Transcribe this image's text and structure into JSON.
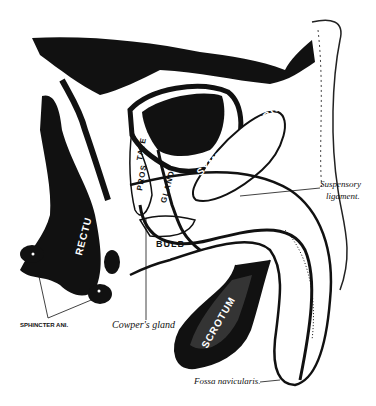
{
  "figure": {
    "colors": {
      "ink": "#111111",
      "paper": "#ffffff"
    },
    "labels": {
      "symphysis_pubis": "SYMPHYSIS PUBIS",
      "prostate_part1": "PROS",
      "prostate_part2": "TATE",
      "gland": "GLAND",
      "rectum": "RECTU",
      "bulb": "BULB",
      "scrotum": "SCROTUM",
      "sphincter_ani": "SPHINCTER ANI.",
      "cowpers_gland": "Cowper's gland",
      "suspensory_ligament_1": "Suspensory",
      "suspensory_ligament_2": "ligament.",
      "fossa_navicularis": "Fossa navicularis."
    }
  }
}
